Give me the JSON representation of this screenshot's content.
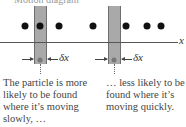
{
  "diagram": {
    "top_caption": "Motion diagram",
    "axis_label": "x",
    "interval_label": "δx",
    "colors": {
      "bar": "#a9a9a9",
      "dot": "#111111",
      "axis": "#555555",
      "text": "#444444"
    },
    "dots_x": [
      25,
      39,
      59,
      93,
      126,
      147,
      161
    ],
    "bars": [
      {
        "left": 34,
        "note_lines": [
          "The particle is more",
          "likely to be found",
          "where it’s moving",
          "slowly, …"
        ]
      },
      {
        "left": 107,
        "note_lines": [
          "… less likely to be",
          "found where it’s",
          "moving quickly."
        ]
      }
    ]
  }
}
